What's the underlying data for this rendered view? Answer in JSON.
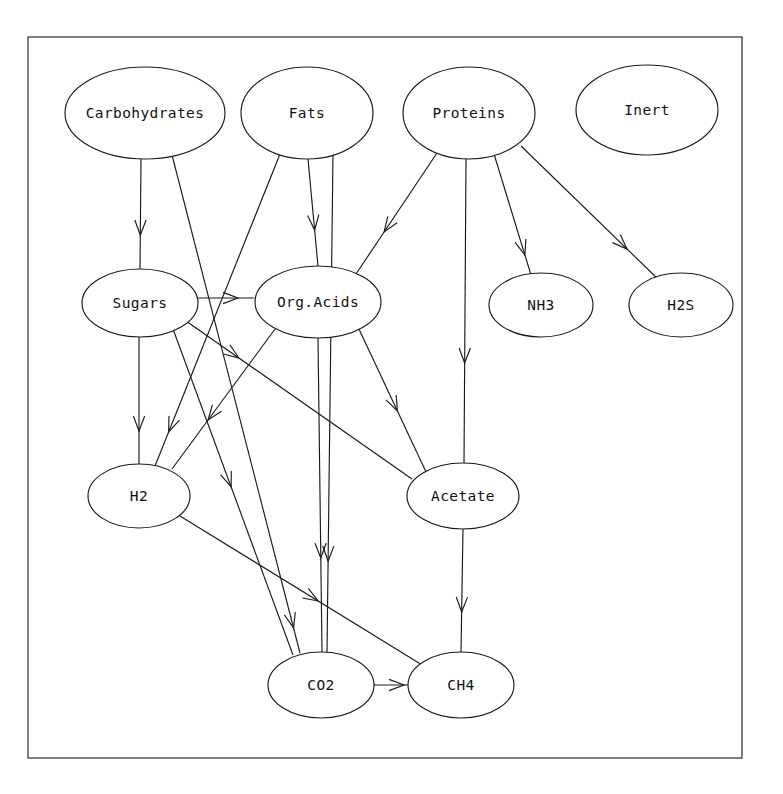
{
  "diagram": {
    "frame": {
      "x": 28,
      "y": 37,
      "width": 714,
      "height": 721
    },
    "background_color": "#ffffff",
    "stroke_color": "#1a1a1a",
    "nodes": [
      {
        "id": "carbohydrates",
        "label": "Carbohydrates",
        "cx": 145,
        "cy": 113,
        "rx": 80,
        "ry": 46
      },
      {
        "id": "fats",
        "label": "Fats",
        "cx": 307,
        "cy": 113,
        "rx": 66,
        "ry": 46
      },
      {
        "id": "proteins",
        "label": "Proteins",
        "cx": 469,
        "cy": 113,
        "rx": 66,
        "ry": 46
      },
      {
        "id": "inert",
        "label": "Inert",
        "cx": 647,
        "cy": 110,
        "rx": 71,
        "ry": 45
      },
      {
        "id": "sugars",
        "label": "Sugars",
        "cx": 140,
        "cy": 303,
        "rx": 58,
        "ry": 34
      },
      {
        "id": "orgacids",
        "label": "Org.Acids",
        "cx": 318,
        "cy": 302,
        "rx": 63,
        "ry": 36
      },
      {
        "id": "nh3",
        "label": "NH3",
        "cx": 541,
        "cy": 305,
        "rx": 52,
        "ry": 32
      },
      {
        "id": "h2s",
        "label": "H2S",
        "cx": 681,
        "cy": 305,
        "rx": 52,
        "ry": 32
      },
      {
        "id": "h2",
        "label": "H2",
        "cx": 139,
        "cy": 496,
        "rx": 51,
        "ry": 32
      },
      {
        "id": "acetate",
        "label": "Acetate",
        "cx": 463,
        "cy": 496,
        "rx": 56,
        "ry": 33
      },
      {
        "id": "co2",
        "label": "CO2",
        "cx": 321,
        "cy": 685,
        "rx": 53,
        "ry": 33
      },
      {
        "id": "ch4",
        "label": "CH4",
        "cx": 461,
        "cy": 685,
        "rx": 53,
        "ry": 33
      }
    ],
    "edges": [
      {
        "from": "carbohydrates",
        "to": "sugars",
        "x1": 141,
        "y1": 159,
        "x2": 140,
        "y2": 269,
        "head": 235
      },
      {
        "from": "carbohydrates",
        "to": "co2",
        "x1": 172,
        "y1": 155,
        "x2": 300,
        "y2": 653,
        "head": 628
      },
      {
        "from": "fats",
        "to": "orgacids",
        "x1": 308,
        "y1": 159,
        "x2": 318,
        "y2": 266,
        "head": 230
      },
      {
        "from": "fats",
        "to": "h2",
        "x1": 280,
        "y1": 154,
        "x2": 155,
        "y2": 466,
        "head": 432
      },
      {
        "from": "fats",
        "to": "co2",
        "x1": 333,
        "y1": 153,
        "x2": 327,
        "y2": 653,
        "head": 561
      },
      {
        "from": "proteins",
        "to": "orgacids",
        "x1": 437,
        "y1": 153,
        "x2": 352,
        "y2": 280,
        "head": 232
      },
      {
        "from": "proteins",
        "to": "acetate",
        "x1": 466,
        "y1": 159,
        "x2": 464,
        "y2": 463,
        "head": 363
      },
      {
        "from": "proteins",
        "to": "nh3",
        "x1": 494,
        "y1": 154,
        "x2": 531,
        "y2": 275,
        "head": 255
      },
      {
        "from": "proteins",
        "to": "h2s",
        "x1": 521,
        "y1": 146,
        "x2": 660,
        "y2": 281,
        "head": 249
      },
      {
        "from": "sugars",
        "to": "orgacids",
        "x1": 196,
        "y1": 298,
        "x2": 254,
        "y2": 298,
        "head": 238
      },
      {
        "from": "sugars",
        "to": "h2",
        "x1": 139,
        "y1": 337,
        "x2": 139,
        "y2": 464,
        "head": 431
      },
      {
        "from": "sugars",
        "to": "acetate",
        "x1": 186,
        "y1": 321,
        "x2": 412,
        "y2": 479,
        "head": 358
      },
      {
        "from": "sugars",
        "to": "co2",
        "x1": 173,
        "y1": 329,
        "x2": 293,
        "y2": 655,
        "head": 487
      },
      {
        "from": "orgacids",
        "to": "acetate",
        "x1": 358,
        "y1": 327,
        "x2": 427,
        "y2": 474,
        "head": 411
      },
      {
        "from": "orgacids",
        "to": "co2",
        "x1": 318,
        "y1": 338,
        "x2": 322,
        "y2": 652,
        "head": 558
      },
      {
        "from": "orgacids",
        "to": "h2",
        "x1": 278,
        "y1": 325,
        "x2": 172,
        "y2": 469,
        "head": 420
      },
      {
        "from": "h2",
        "to": "ch4",
        "x1": 180,
        "y1": 516,
        "x2": 427,
        "y2": 668,
        "head": 601
      },
      {
        "from": "acetate",
        "to": "ch4",
        "x1": 463,
        "y1": 529,
        "x2": 461,
        "y2": 652,
        "head": 612
      },
      {
        "from": "co2",
        "to": "ch4",
        "x1": 374,
        "y1": 685,
        "x2": 408,
        "y2": 685,
        "head": 404
      }
    ]
  }
}
